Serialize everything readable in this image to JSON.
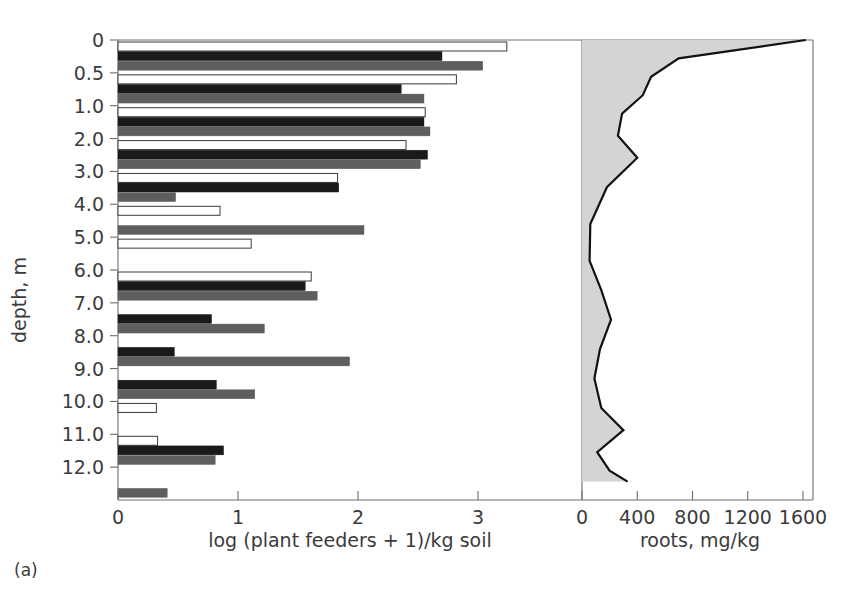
{
  "figure": {
    "caption": "(a)",
    "y_axis_title": "depth, m",
    "left_panel": {
      "x_axis_title": "log (plant feeders + 1)/kg soil",
      "x_ticks": [
        "0",
        "1",
        "2",
        "3"
      ],
      "x_tick_values": [
        0,
        1,
        2,
        3
      ],
      "xlim": [
        0,
        3.55
      ]
    },
    "right_panel": {
      "x_axis_title": "roots, mg/kg",
      "x_ticks": [
        "0",
        "400",
        "800",
        "1200",
        "1600"
      ],
      "x_tick_values": [
        0,
        400,
        800,
        1200,
        1600
      ],
      "xlim": [
        0,
        1660
      ]
    },
    "y_ticks": [
      "0",
      "0.5",
      "1.0",
      "2.0",
      "3.0",
      "4.0",
      "5.0",
      "6.0",
      "7.0",
      "8.0",
      "9.0",
      "10.0",
      "11.0",
      "12.0"
    ],
    "colors": {
      "series_white": "#ffffff",
      "series_black": "#1a1a1a",
      "series_gray": "#5e5e5e",
      "roots_fill": "#d4d4d4",
      "roots_line": "#121212",
      "axis": "#6e6e6e",
      "text": "#3b3b3b"
    }
  },
  "chart_data": {
    "type": "bar",
    "title": "",
    "subtitle": "",
    "orientation": "horizontal",
    "panels": 2,
    "grid": false,
    "legend": "none",
    "ylabel": "depth, m",
    "categories": [
      "0",
      "0.5",
      "1.0",
      "2.0",
      "3.0",
      "4.0",
      "5.0",
      "6.0",
      "7.0",
      "8.0",
      "9.0",
      "10.0",
      "11.0",
      "12.0"
    ],
    "ylim": [
      0,
      12.5
    ],
    "panel_left": {
      "type": "bar",
      "xlabel": "log (plant feeders + 1)/kg soil",
      "xlim": [
        0,
        3.55
      ],
      "xticks": [
        0,
        1,
        2,
        3
      ],
      "series": [
        {
          "name": "white",
          "fill": "#ffffff",
          "values": [
            3.24,
            2.82,
            2.56,
            2.4,
            1.83,
            0.85,
            1.11,
            1.61,
            0.0,
            0.0,
            0.0,
            0.32,
            0.33,
            0.0
          ]
        },
        {
          "name": "black",
          "fill": "#1a1a1a",
          "values": [
            2.7,
            2.36,
            2.55,
            2.58,
            1.84,
            0.0,
            0.0,
            1.56,
            0.78,
            0.47,
            0.82,
            0.0,
            0.88,
            0.0
          ]
        },
        {
          "name": "gray",
          "fill": "#5e5e5e",
          "values": [
            3.04,
            2.55,
            2.6,
            2.52,
            0.48,
            2.05,
            0.0,
            1.66,
            1.22,
            1.93,
            1.14,
            0.0,
            0.81,
            0.41
          ]
        }
      ]
    },
    "panel_right": {
      "type": "area",
      "xlabel": "roots, mg/kg",
      "xlim": [
        0,
        1660
      ],
      "xticks": [
        0,
        400,
        800,
        1200,
        1600
      ],
      "series": [
        {
          "name": "roots",
          "fill": "#d4d4d4",
          "line": "#121212",
          "depths": [
            0.0,
            0.5,
            1.0,
            1.5,
            2.0,
            2.6,
            3.2,
            4.0,
            5.0,
            6.0,
            6.8,
            7.6,
            8.4,
            9.2,
            10.0,
            10.6,
            11.2,
            11.7,
            12.0
          ],
          "values": [
            1620,
            700,
            500,
            440,
            290,
            260,
            400,
            180,
            60,
            55,
            140,
            210,
            130,
            90,
            140,
            300,
            110,
            200,
            330
          ]
        }
      ]
    }
  }
}
